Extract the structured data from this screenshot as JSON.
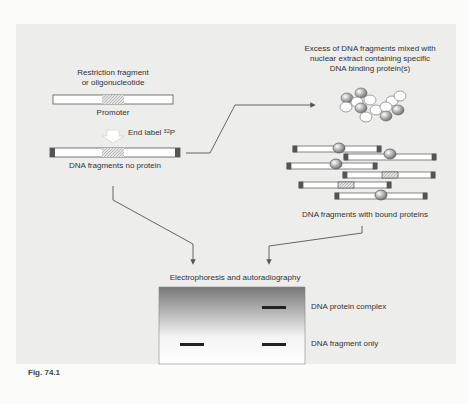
{
  "figure": {
    "caption": "Fig. 74.1",
    "labels": {
      "restriction_fragment_line1": "Restriction fragment",
      "restriction_fragment_line2": "or oligonucleotide",
      "promoter": "Promoter",
      "end_label": "End label",
      "end_label_isotope": "32",
      "end_label_element": "P",
      "dna_no_protein": "DNA fragments no protein",
      "excess_line1": "Excess of DNA fragments mixed with",
      "excess_line2": "nuclear extract containing specific",
      "excess_line3": "DNA binding protein(s)",
      "dna_bound": "DNA fragments with bound proteins",
      "electrophoresis": "Electrophoresis and autoradiography",
      "complex": "DNA protein complex",
      "fragment_only": "DNA fragment only"
    },
    "colors": {
      "background": "#ededeb",
      "line": "#555555",
      "end_cap": "#555555",
      "promoter_fill": "#d6d6d6",
      "gel_top": "#7a7a7a",
      "gel_bottom": "#ffffff",
      "band": "#222222"
    }
  }
}
